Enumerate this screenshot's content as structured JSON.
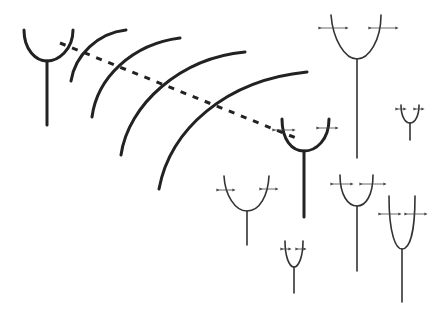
{
  "diagram": {
    "title": "",
    "colors": {
      "stroke": "#222222",
      "background": "#ffffff"
    },
    "transmitter": {
      "label": "",
      "type": "antenna"
    },
    "wavefronts": {
      "count": 5
    },
    "signal_path": {
      "style": "dashed"
    },
    "primary_receiver": {
      "label": "",
      "type": "antenna"
    },
    "other_antennas": {
      "count": 6,
      "marker": "polarization-arrows"
    }
  }
}
